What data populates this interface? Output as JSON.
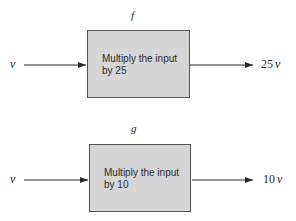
{
  "functions": [
    {
      "name": "f",
      "box_text_line1": "Multiply the input",
      "box_text_line2": "by  25",
      "input": "v",
      "output_coefficient": "25",
      "output_variable": "v",
      "multiplier": 25
    },
    {
      "name": "g",
      "box_text_line1": "Multiply the input",
      "box_text_line2": "by  10",
      "input": "v",
      "output_coefficient": "10",
      "output_variable": "v",
      "multiplier": 10
    }
  ],
  "colors": {
    "box_fill": "#d6d6d6",
    "line": "#2a2a2a"
  }
}
